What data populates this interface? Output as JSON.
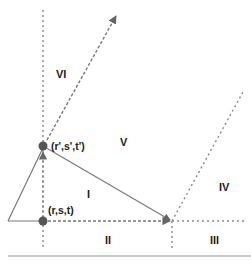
{
  "diagram": {
    "points": {
      "origin": {
        "label": "(r,s,t)"
      },
      "target": {
        "label": "(r',s',t')"
      }
    },
    "regions": [
      {
        "id": "I",
        "label": "I"
      },
      {
        "id": "II",
        "label": "II"
      },
      {
        "id": "III",
        "label": "III"
      },
      {
        "id": "IV",
        "label": "IV"
      },
      {
        "id": "V",
        "label": "V"
      },
      {
        "id": "VI",
        "label": "VI"
      }
    ],
    "colors": {
      "line": "#7a7a7a",
      "dotted": "#888888",
      "point": "#555555",
      "text": "#222222",
      "rule": "#c8c8c8"
    }
  }
}
